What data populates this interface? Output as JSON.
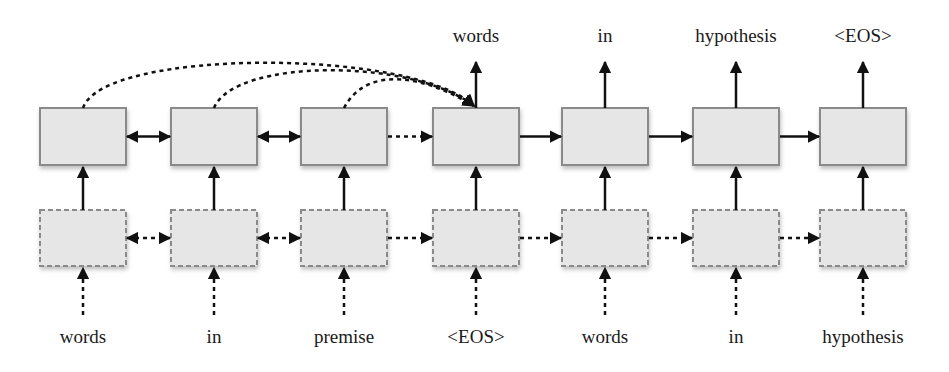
{
  "diagram": {
    "colors": {
      "box_fill": "#e6e6e6",
      "box_stroke": "#8a8a8a",
      "arrow": "#111111",
      "text": "#1a1a1a"
    },
    "columns_x": [
      83,
      214,
      344,
      476,
      605,
      736,
      863
    ],
    "output_labels": [
      {
        "col": 3,
        "text": "words"
      },
      {
        "col": 4,
        "text": "in"
      },
      {
        "col": 5,
        "text": "hypothesis"
      },
      {
        "col": 6,
        "text": "<EOS>"
      }
    ],
    "input_labels": [
      {
        "col": 0,
        "text": "words"
      },
      {
        "col": 1,
        "text": "in"
      },
      {
        "col": 2,
        "text": "premise"
      },
      {
        "col": 3,
        "text": "<EOS>"
      },
      {
        "col": 4,
        "text": "words"
      },
      {
        "col": 5,
        "text": "in"
      },
      {
        "col": 6,
        "text": "hypothesis"
      }
    ],
    "top_row": {
      "style": "solid",
      "y": 108,
      "h": 57,
      "w": 86
    },
    "bottom_row": {
      "style": "dashed",
      "y": 210,
      "h": 56,
      "w": 86
    },
    "top_connections": [
      {
        "from": 0,
        "to": 1,
        "type": "bidirectional-solid"
      },
      {
        "from": 1,
        "to": 2,
        "type": "bidirectional-solid"
      },
      {
        "from": 2,
        "to": 3,
        "type": "dashed"
      },
      {
        "from": 3,
        "to": 4,
        "type": "solid"
      },
      {
        "from": 4,
        "to": 5,
        "type": "solid"
      },
      {
        "from": 5,
        "to": 6,
        "type": "solid"
      }
    ],
    "bottom_connections": [
      {
        "from": 0,
        "to": 1,
        "type": "bidirectional-dashed"
      },
      {
        "from": 1,
        "to": 2,
        "type": "bidirectional-dashed"
      },
      {
        "from": 2,
        "to": 3,
        "type": "dashed"
      },
      {
        "from": 3,
        "to": 4,
        "type": "dashed"
      },
      {
        "from": 4,
        "to": 5,
        "type": "dashed"
      },
      {
        "from": 5,
        "to": 6,
        "type": "dashed"
      }
    ],
    "attention_arcs": [
      {
        "from": 0,
        "to": 3
      },
      {
        "from": 1,
        "to": 3
      },
      {
        "from": 2,
        "to": 3
      }
    ]
  }
}
